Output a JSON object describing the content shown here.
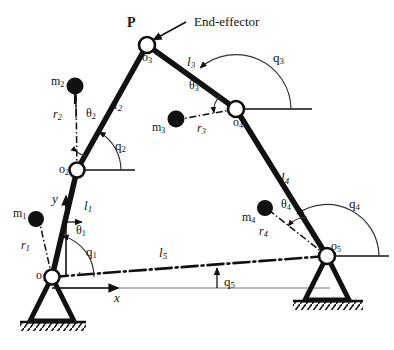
{
  "figure": {
    "type": "kinematic-linkage-diagram",
    "background_color": "#ffffff",
    "line_color": "#111111",
    "thin_line_color": "#555555"
  },
  "annotations": {
    "end_effector_label": "End-effector",
    "point_p": "P",
    "axis_x": "x",
    "axis_y": "y"
  },
  "joints": [
    {
      "id": "o1",
      "label": "o",
      "sub": "1",
      "x": 52,
      "y": 277,
      "grounded": true,
      "label_dx": -16,
      "label_dy": -8
    },
    {
      "id": "o2",
      "label": "o",
      "sub": "2",
      "x": 77,
      "y": 170,
      "grounded": false,
      "label_dx": -18,
      "label_dy": -7
    },
    {
      "id": "o3",
      "label": "o",
      "sub": "3",
      "x": 147,
      "y": 45,
      "grounded": false,
      "label_dx": -5,
      "label_dy": 6
    },
    {
      "id": "o4",
      "label": "o",
      "sub": "4",
      "x": 236,
      "y": 109,
      "grounded": false,
      "label_dx": -3,
      "label_dy": 7
    },
    {
      "id": "o5",
      "label": "o",
      "sub": "5",
      "x": 327,
      "y": 256,
      "grounded": true,
      "label_dx": 4,
      "label_dy": -8
    }
  ],
  "links": [
    {
      "id": "l1",
      "label": "l",
      "sub": "1",
      "from": "o1",
      "to": "o2",
      "style": "solid",
      "label_x": 86,
      "label_y": 205
    },
    {
      "id": "l2",
      "label": "l",
      "sub": "2",
      "from": "o2",
      "to": "o3",
      "style": "solid",
      "label_x": 117,
      "label_y": 104
    },
    {
      "id": "l3",
      "label": "l",
      "sub": "3",
      "from": "o3",
      "to": "o4",
      "style": "solid",
      "label_x": 190,
      "label_y": 61
    },
    {
      "id": "l4",
      "label": "l",
      "sub": "4",
      "from": "o4",
      "to": "o5",
      "style": "solid",
      "label_x": 283,
      "label_y": 177
    },
    {
      "id": "l5",
      "label": "l",
      "sub": "5",
      "from": "o1",
      "to": "o5",
      "style": "dash-dot",
      "label_x": 162,
      "label_y": 252
    }
  ],
  "masses": [
    {
      "id": "m1",
      "label": "m",
      "sub": "1",
      "x": 36,
      "y": 219,
      "r_label": "r",
      "r_sub": "1",
      "r_label_x": 24,
      "r_label_y": 246,
      "theta_label": "θ",
      "theta_sub": "1",
      "theta_x": 79,
      "theta_y": 231,
      "label_x": 16,
      "label_y": 214
    },
    {
      "id": "m2",
      "label": "m",
      "sub": "2",
      "x": 75,
      "y": 86,
      "r_label": "r",
      "r_sub": "2",
      "r_label_x": 56,
      "r_label_y": 115,
      "theta_label": "θ",
      "theta_sub": "2",
      "theta_x": 89,
      "theta_y": 114,
      "label_x": 54,
      "label_y": 82
    },
    {
      "id": "m3",
      "label": "m",
      "sub": "3",
      "x": 176,
      "y": 119,
      "r_label": "r",
      "r_sub": "3",
      "r_label_x": 200,
      "r_label_y": 128,
      "theta_label": "θ",
      "theta_sub": "3",
      "theta_x": 192,
      "theta_y": 86,
      "label_x": 155,
      "label_y": 128
    },
    {
      "id": "m4",
      "label": "m",
      "sub": "4",
      "x": 265,
      "y": 208,
      "r_label": "r",
      "r_sub": "4",
      "r_label_x": 262,
      "r_label_y": 232,
      "theta_label": "θ",
      "theta_sub": "4",
      "theta_x": 284,
      "theta_y": 205,
      "label_x": 245,
      "label_y": 218
    }
  ],
  "angles": [
    {
      "id": "q1",
      "label": "q",
      "sub": "1",
      "at_joint": "o1",
      "label_x": 89,
      "label_y": 252,
      "radius": 42
    },
    {
      "id": "q2",
      "label": "q",
      "sub": "2",
      "at_joint": "o2",
      "label_x": 118,
      "label_y": 146,
      "radius": 44
    },
    {
      "id": "q3",
      "label": "q",
      "sub": "3",
      "at_joint": "o4",
      "label_x": 276,
      "label_y": 58,
      "radius": 55
    },
    {
      "id": "q4",
      "label": "q",
      "sub": "4",
      "at_joint": "o5",
      "label_x": 352,
      "label_y": 204,
      "radius": 52
    },
    {
      "id": "q5",
      "label": "q",
      "sub": "5",
      "at_joint": "o1",
      "label_x": 227,
      "label_y": 282,
      "radius": 0
    }
  ]
}
